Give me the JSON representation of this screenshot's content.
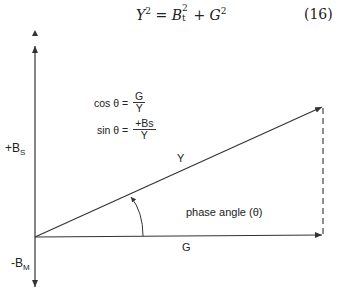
{
  "equation": {
    "lhs": "Y",
    "lhs_exp": "2",
    "equals": "=",
    "term1_base": "B",
    "term1_sup": "2",
    "term1_sub": "t",
    "plus": "+",
    "term2_base": "G",
    "term2_exp": "2",
    "number": "(16)"
  },
  "formulas": {
    "cos_label": "cos θ =",
    "cos_num": "G",
    "cos_den": "Y",
    "sin_label": "sin θ =",
    "sin_num": "+Bs",
    "sin_den": "Y"
  },
  "axis_labels": {
    "top_base": "+B",
    "top_sub": "S",
    "bottom_base": "-B",
    "bottom_sub": "M"
  },
  "vector_labels": {
    "hypotenuse": "Y",
    "horizontal": "G",
    "angle": "phase angle (θ)"
  },
  "colors": {
    "line": "#333333",
    "text": "#222222",
    "background": "#ffffff"
  }
}
